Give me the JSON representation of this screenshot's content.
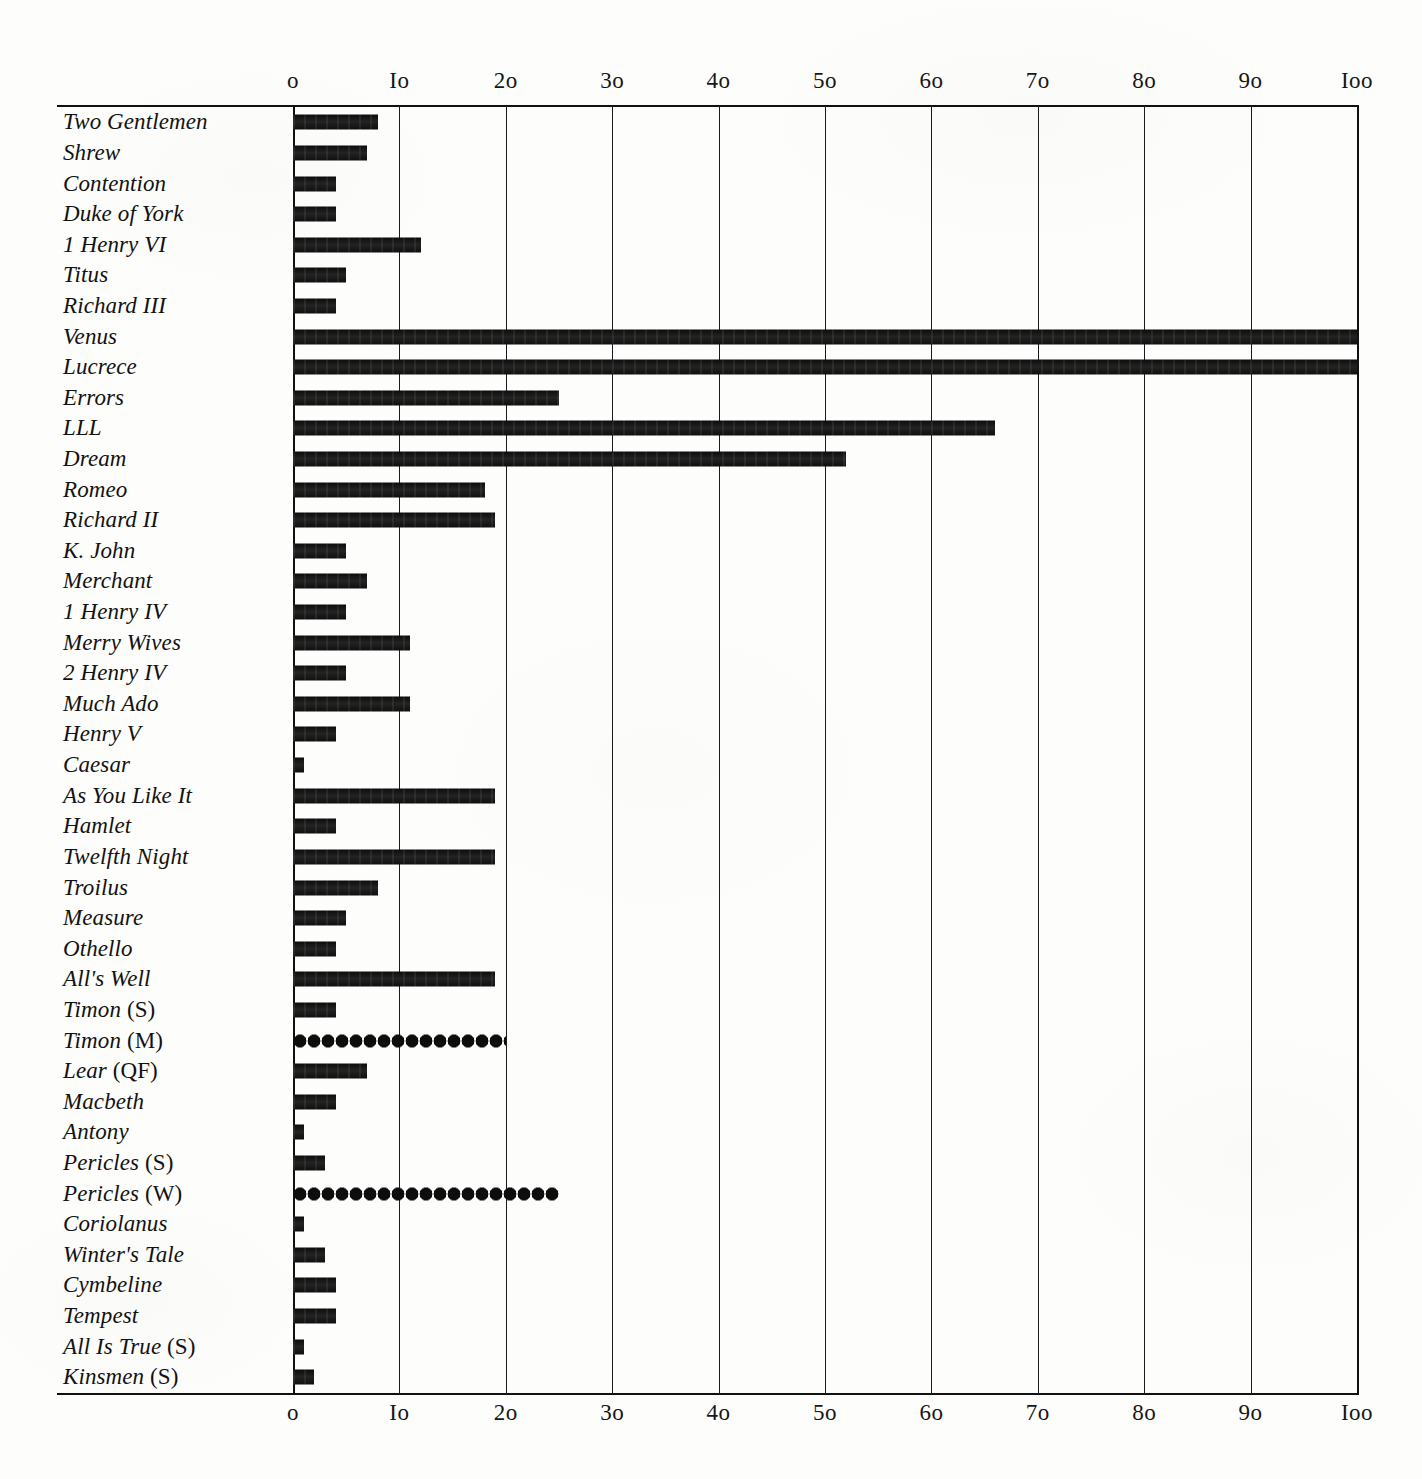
{
  "chart_data": {
    "type": "bar",
    "orientation": "horizontal",
    "title": "",
    "subtitle": "",
    "xlabel": "",
    "ylabel": "",
    "xlim": [
      0,
      100
    ],
    "xticks": [
      0,
      10,
      20,
      30,
      40,
      50,
      60,
      70,
      80,
      90,
      100
    ],
    "xtick_labels": [
      "o",
      "Io",
      "2o",
      "3o",
      "4o",
      "5o",
      "6o",
      "7o",
      "8o",
      "9o",
      "Ioo"
    ],
    "grid": "vertical",
    "legend": "none",
    "axis_positions": [
      "top",
      "bottom"
    ],
    "categories": [
      "Two Gentlemen",
      "Shrew",
      "Contention",
      "Duke of York",
      "1 Henry VI",
      "Titus",
      "Richard III",
      "Venus",
      "Lucrece",
      "Errors",
      "LLL",
      "Dream",
      "Romeo",
      "Richard II",
      "K. John",
      "Merchant",
      "1 Henry IV",
      "Merry Wives",
      "2 Henry IV",
      "Much Ado",
      "Henry V",
      "Caesar",
      "As You Like It",
      "Hamlet",
      "Twelfth Night",
      "Troilus",
      "Measure",
      "Othello",
      "All's Well",
      "Timon (S)",
      "Timon (M)",
      "Lear (QF)",
      "Macbeth",
      "Antony",
      "Pericles (S)",
      "Pericles (W)",
      "Coriolanus",
      "Winter's Tale",
      "Cymbeline",
      "Tempest",
      "All Is True (S)",
      "Kinsmen (S)"
    ],
    "values": [
      8,
      7,
      4,
      4,
      12,
      5,
      4,
      100,
      100,
      25,
      66,
      52,
      18,
      19,
      5,
      7,
      5,
      11,
      5,
      11,
      4,
      1,
      19,
      4,
      19,
      8,
      5,
      4,
      19,
      4,
      20,
      7,
      4,
      1,
      3,
      25,
      1,
      3,
      4,
      4,
      1,
      2
    ],
    "bar_styles": [
      "solid",
      "solid",
      "solid",
      "solid",
      "solid",
      "solid",
      "solid",
      "solid",
      "solid",
      "solid",
      "solid",
      "solid",
      "solid",
      "solid",
      "solid",
      "solid",
      "solid",
      "solid",
      "solid",
      "solid",
      "solid",
      "solid",
      "solid",
      "solid",
      "solid",
      "solid",
      "solid",
      "solid",
      "solid",
      "solid",
      "beaded",
      "solid",
      "solid",
      "solid",
      "solid",
      "beaded",
      "solid",
      "solid",
      "solid",
      "solid",
      "solid",
      "solid"
    ]
  },
  "rows": [
    {
      "label": "Two Gentlemen",
      "italic_part": "Two Gentlemen",
      "paren_part": "",
      "value": 8,
      "style": "solid"
    },
    {
      "label": "Shrew",
      "italic_part": "Shrew",
      "paren_part": "",
      "value": 7,
      "style": "solid"
    },
    {
      "label": "Contention",
      "italic_part": "Contention",
      "paren_part": "",
      "value": 4,
      "style": "solid"
    },
    {
      "label": "Duke of York",
      "italic_part": "Duke of York",
      "paren_part": "",
      "value": 4,
      "style": "solid"
    },
    {
      "label": "1 Henry VI",
      "italic_part": "1 Henry VI",
      "paren_part": "",
      "value": 12,
      "style": "solid"
    },
    {
      "label": "Titus",
      "italic_part": "Titus",
      "paren_part": "",
      "value": 5,
      "style": "solid"
    },
    {
      "label": "Richard III",
      "italic_part": "Richard III",
      "paren_part": "",
      "value": 4,
      "style": "solid"
    },
    {
      "label": "Venus",
      "italic_part": "Venus",
      "paren_part": "",
      "value": 100,
      "style": "solid"
    },
    {
      "label": "Lucrece",
      "italic_part": "Lucrece",
      "paren_part": "",
      "value": 100,
      "style": "solid"
    },
    {
      "label": "Errors",
      "italic_part": "Errors",
      "paren_part": "",
      "value": 25,
      "style": "solid"
    },
    {
      "label": "LLL",
      "italic_part": "LLL",
      "paren_part": "",
      "value": 66,
      "style": "solid"
    },
    {
      "label": "Dream",
      "italic_part": "Dream",
      "paren_part": "",
      "value": 52,
      "style": "solid"
    },
    {
      "label": "Romeo",
      "italic_part": "Romeo",
      "paren_part": "",
      "value": 18,
      "style": "solid"
    },
    {
      "label": "Richard II",
      "italic_part": "Richard II",
      "paren_part": "",
      "value": 19,
      "style": "solid"
    },
    {
      "label": "K. John",
      "italic_part": "K. John",
      "paren_part": "",
      "value": 5,
      "style": "solid"
    },
    {
      "label": "Merchant",
      "italic_part": "Merchant",
      "paren_part": "",
      "value": 7,
      "style": "solid"
    },
    {
      "label": "1 Henry IV",
      "italic_part": "1 Henry IV",
      "paren_part": "",
      "value": 5,
      "style": "solid"
    },
    {
      "label": "Merry Wives",
      "italic_part": "Merry Wives",
      "paren_part": "",
      "value": 11,
      "style": "solid"
    },
    {
      "label": "2 Henry IV",
      "italic_part": "2 Henry IV",
      "paren_part": "",
      "value": 5,
      "style": "solid"
    },
    {
      "label": "Much Ado",
      "italic_part": "Much Ado",
      "paren_part": "",
      "value": 11,
      "style": "solid"
    },
    {
      "label": "Henry V",
      "italic_part": "Henry V",
      "paren_part": "",
      "value": 4,
      "style": "solid"
    },
    {
      "label": "Caesar",
      "italic_part": "Caesar",
      "paren_part": "",
      "value": 1,
      "style": "solid"
    },
    {
      "label": "As You Like It",
      "italic_part": "As You Like It",
      "paren_part": "",
      "value": 19,
      "style": "solid"
    },
    {
      "label": "Hamlet",
      "italic_part": "Hamlet",
      "paren_part": "",
      "value": 4,
      "style": "solid"
    },
    {
      "label": "Twelfth Night",
      "italic_part": "Twelfth Night",
      "paren_part": "",
      "value": 19,
      "style": "solid"
    },
    {
      "label": "Troilus",
      "italic_part": "Troilus",
      "paren_part": "",
      "value": 8,
      "style": "solid"
    },
    {
      "label": "Measure",
      "italic_part": "Measure",
      "paren_part": "",
      "value": 5,
      "style": "solid"
    },
    {
      "label": "Othello",
      "italic_part": "Othello",
      "paren_part": "",
      "value": 4,
      "style": "solid"
    },
    {
      "label": "All's Well",
      "italic_part": "All's Well",
      "paren_part": "",
      "value": 19,
      "style": "solid"
    },
    {
      "label": "Timon (S)",
      "italic_part": "Timon",
      "paren_part": "(S)",
      "value": 4,
      "style": "solid"
    },
    {
      "label": "Timon (M)",
      "italic_part": "Timon",
      "paren_part": "(M)",
      "value": 20,
      "style": "beaded"
    },
    {
      "label": "Lear (QF)",
      "italic_part": "Lear",
      "paren_part": "(QF)",
      "value": 7,
      "style": "solid"
    },
    {
      "label": "Macbeth",
      "italic_part": "Macbeth",
      "paren_part": "",
      "value": 4,
      "style": "solid"
    },
    {
      "label": "Antony",
      "italic_part": "Antony",
      "paren_part": "",
      "value": 1,
      "style": "solid"
    },
    {
      "label": "Pericles (S)",
      "italic_part": "Pericles",
      "paren_part": "(S)",
      "value": 3,
      "style": "solid"
    },
    {
      "label": "Pericles (W)",
      "italic_part": "Pericles",
      "paren_part": "(W)",
      "value": 25,
      "style": "beaded"
    },
    {
      "label": "Coriolanus",
      "italic_part": "Coriolanus",
      "paren_part": "",
      "value": 1,
      "style": "solid"
    },
    {
      "label": "Winter's Tale",
      "italic_part": "Winter's Tale",
      "paren_part": "",
      "value": 3,
      "style": "solid"
    },
    {
      "label": "Cymbeline",
      "italic_part": "Cymbeline",
      "paren_part": "",
      "value": 4,
      "style": "solid"
    },
    {
      "label": "Tempest",
      "italic_part": "Tempest",
      "paren_part": "",
      "value": 4,
      "style": "solid"
    },
    {
      "label": "All Is True (S)",
      "italic_part": "All Is True",
      "paren_part": "(S)",
      "value": 1,
      "style": "solid"
    },
    {
      "label": "Kinsmen (S)",
      "italic_part": "Kinsmen",
      "paren_part": "(S)",
      "value": 2,
      "style": "solid"
    }
  ],
  "colors": {
    "ink": "#121212",
    "paper": "#fdfdfb",
    "rule": "#111111"
  }
}
